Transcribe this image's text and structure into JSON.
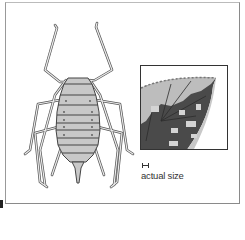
{
  "illustration": {
    "subject": "aphid",
    "colors": {
      "body_fill": "#c8c8c8",
      "outline": "#555555",
      "frame": "#8a8a8a",
      "leaf_dark": "#4a4a4a",
      "leaf_light": "#bdbdbd"
    }
  },
  "inset": {
    "subject": "leaf-with-aphid-infestation"
  },
  "scale": {
    "caption": "actual size",
    "icon": "scale-bar-icon"
  }
}
